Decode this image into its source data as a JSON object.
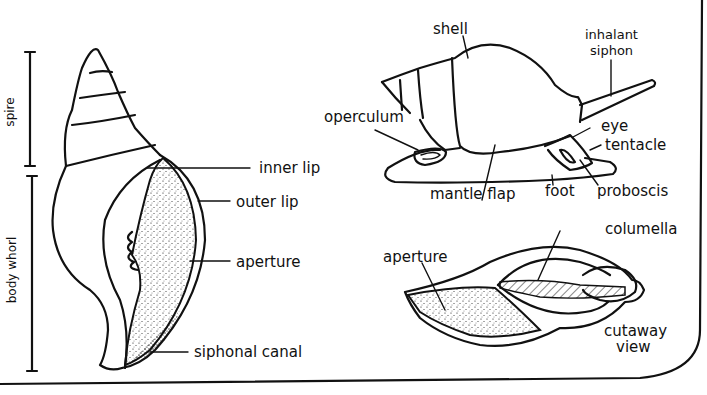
{
  "diagram": {
    "left_view": {
      "dimension_labels": {
        "spire": "spire",
        "body_whorl": "body whorl"
      },
      "labels": {
        "inner_lip": "inner lip",
        "outer_lip": "outer lip",
        "aperture": "aperture",
        "siphonal_canal": "siphonal canal"
      }
    },
    "live_animal_view": {
      "labels": {
        "shell": "shell",
        "inhalant_siphon_line1": "inhalant",
        "inhalant_siphon_line2": "siphon",
        "operculum": "operculum",
        "eye": "eye",
        "tentacle": "tentacle",
        "mantle_flap": "mantle flap",
        "foot": "foot",
        "proboscis": "proboscis"
      }
    },
    "cutaway_view": {
      "labels": {
        "aperture": "aperture",
        "columella": "columella",
        "caption_line1": "cutaway",
        "caption_line2": "view"
      }
    }
  },
  "colors": {
    "ink": "#111111",
    "background": "#ffffff"
  }
}
